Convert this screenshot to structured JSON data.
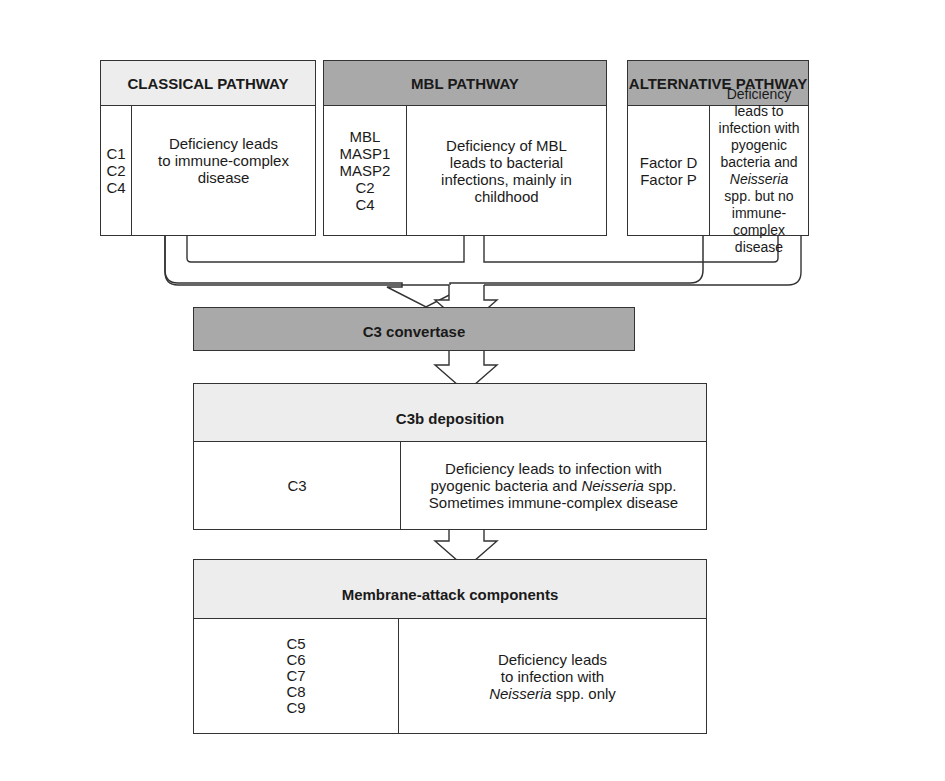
{
  "pathways": [
    {
      "title": "CLASSICAL PATHWAY",
      "components": "C1\nC2\nC4",
      "description": "Deficiency leads\nto immune-complex\ndisease",
      "header_color": "#ededed"
    },
    {
      "title": "MBL PATHWAY",
      "components": "MBL\nMASP1\nMASP2\nC2\nC4",
      "description": "Deficiency of MBL\nleads to bacterial\ninfections, mainly in\nchildhood",
      "header_color": "#a9a9a9"
    },
    {
      "title": "ALTERNATIVE PATHWAY",
      "components": "Factor D\nFactor P",
      "description_parts": [
        "Deficiency leads to\ninfection with pyogenic\nbacteria and ",
        "Neisseria",
        "\nspp. but no immune-\ncomplex disease"
      ],
      "header_color": "#a9a9a9"
    }
  ],
  "convertase": {
    "title": "C3 convertase",
    "color": "#a9a9a9"
  },
  "c3b": {
    "title": "C3b deposition",
    "components": "C3",
    "desc_line1": "Deficiency leads to infection with",
    "desc_line2_pre": "pyogenic bacteria and ",
    "desc_line2_italic": "Neisseria",
    "desc_line2_post": " spp.",
    "desc_line3": "Sometimes immune-complex disease"
  },
  "mac": {
    "title": "Membrane-attack components",
    "components": "C5\nC6\nC7\nC8\nC9",
    "desc_line1": "Deficiency leads",
    "desc_line2": "to infection with",
    "desc_line3_italic": "Neisseria",
    "desc_line3_post": " spp. only"
  }
}
